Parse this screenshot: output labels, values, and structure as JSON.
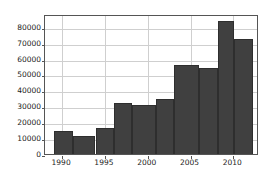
{
  "chart_data": {
    "type": "bar",
    "title": "",
    "subtitle": "",
    "xlabel": "",
    "ylabel": "",
    "grid": true,
    "legend": null,
    "xlim": [
      1988.6,
      1000
    ],
    "x_axis": {
      "min": 1988.0,
      "max": 2013.0
    },
    "ylim": [
      0,
      88000
    ],
    "bin_width": 1.5,
    "xticks": [
      1990,
      1995,
      2000,
      2005,
      2010
    ],
    "xtick_labels": [
      "1990",
      "1995",
      "2000",
      "2005",
      "2010"
    ],
    "yticks": [
      0,
      10000,
      20000,
      30000,
      40000,
      50000,
      60000,
      70000,
      80000
    ],
    "ytick_labels": [
      "0",
      "10000",
      "20000",
      "30000",
      "40000",
      "50000",
      "60000",
      "70000",
      "80000"
    ],
    "bars": [
      {
        "label": "1989-1991",
        "x0": 1989.0,
        "x1": 1991.3,
        "value": 14400
      },
      {
        "label": "1991-1994",
        "x0": 1991.3,
        "x1": 1993.9,
        "value": 11500
      },
      {
        "label": "1994-1996",
        "x0": 1993.9,
        "x1": 1996.1,
        "value": 16600
      },
      {
        "label": "1996-1998",
        "x0": 1996.1,
        "x1": 1998.2,
        "value": 31800
      },
      {
        "label": "1998-2001",
        "x0": 1998.2,
        "x1": 2001.0,
        "value": 30500
      },
      {
        "label": "2001-2003",
        "x0": 2001.0,
        "x1": 2003.1,
        "value": 34800
      },
      {
        "label": "2003-2006",
        "x0": 2003.1,
        "x1": 2006.0,
        "value": 55700
      },
      {
        "label": "2006-2008",
        "x0": 2006.0,
        "x1": 2008.2,
        "value": 54000
      },
      {
        "label": "2008-2010",
        "x0": 2008.2,
        "x1": 2010.1,
        "value": 83500
      },
      {
        "label": "2010-2012",
        "x0": 2010.1,
        "x1": 2012.3,
        "value": 72000
      }
    ],
    "colors": {
      "bar": "#404040",
      "bar_edge": "#2e2e2e",
      "grid": "#cfcfcf",
      "axis": "#555555",
      "background": "#ffffff",
      "text": "#222222"
    }
  }
}
